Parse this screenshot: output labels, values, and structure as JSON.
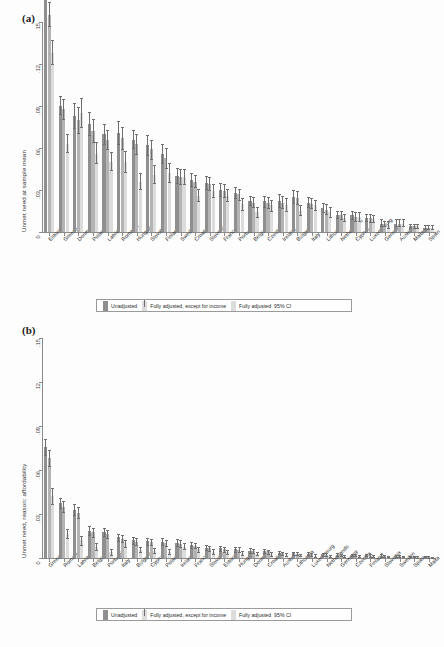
{
  "figure": {
    "panel_a_tag": "(a)",
    "panel_b_tag": "(b)"
  },
  "legend": {
    "unadjusted": "Unadjusted",
    "except_income": "Fully adjusted, except for income",
    "fully_adjusted": "Fully adjusted",
    "ci": "95% CI"
  },
  "chart_data": [
    {
      "type": "bar",
      "panel": "(a)",
      "title": "",
      "xlabel": "",
      "ylabel": "Unmet need at sample mean",
      "ylim": [
        0,
        0.15
      ],
      "yticks": [
        0,
        0.03,
        0.06,
        0.09,
        0.12,
        0.15
      ],
      "ytick_labels": [
        "0",
        ".03",
        ".06",
        ".09",
        ".12",
        ".15"
      ],
      "grid": false,
      "legend_position": "below-plot",
      "error_bars": "95% CI",
      "categories": [
        "Estonia",
        "Greece",
        "Denmark",
        "Poland",
        "Latvia",
        "Romania",
        "Hungary",
        "Slovakia",
        "Finland",
        "Sweden",
        "Croatia",
        "Slovenia",
        "France",
        "Portugal",
        "Belgium",
        "Czechia",
        "Ireland",
        "Bulgaria",
        "Italy",
        "Lithuania",
        "Netherlands",
        "Cyprus",
        "Luxembourg",
        "Germany",
        "Austria",
        "Malta",
        "Spain"
      ],
      "series": [
        {
          "name": "Unadjusted",
          "color": "#8f8f8f",
          "values": [
            0.176,
            0.09,
            0.083,
            0.077,
            0.07,
            0.071,
            0.066,
            0.062,
            0.056,
            0.04,
            0.037,
            0.035,
            0.03,
            0.028,
            0.022,
            0.022,
            0.022,
            0.025,
            0.021,
            0.017,
            0.012,
            0.012,
            0.01,
            0.006,
            0.006,
            0.004,
            0.003
          ],
          "ci_low": [
            0.168,
            0.084,
            0.074,
            0.069,
            0.063,
            0.063,
            0.06,
            0.055,
            0.049,
            0.035,
            0.033,
            0.031,
            0.026,
            0.024,
            0.019,
            0.018,
            0.018,
            0.021,
            0.018,
            0.014,
            0.01,
            0.009,
            0.008,
            0.004,
            0.004,
            0.003,
            0.002
          ],
          "ci_high": [
            0.185,
            0.097,
            0.092,
            0.086,
            0.077,
            0.079,
            0.073,
            0.069,
            0.063,
            0.046,
            0.042,
            0.04,
            0.035,
            0.032,
            0.026,
            0.026,
            0.027,
            0.03,
            0.025,
            0.021,
            0.015,
            0.015,
            0.013,
            0.009,
            0.009,
            0.006,
            0.005
          ]
        },
        {
          "name": "Fully adjusted, except for income",
          "color": "#b4b4b4",
          "values": [
            0.155,
            0.088,
            0.08,
            0.072,
            0.066,
            0.067,
            0.063,
            0.059,
            0.053,
            0.039,
            0.036,
            0.034,
            0.029,
            0.027,
            0.021,
            0.021,
            0.021,
            0.024,
            0.02,
            0.016,
            0.012,
            0.011,
            0.01,
            0.006,
            0.006,
            0.004,
            0.003
          ],
          "ci_low": [
            0.147,
            0.081,
            0.071,
            0.064,
            0.059,
            0.059,
            0.056,
            0.052,
            0.046,
            0.034,
            0.032,
            0.03,
            0.025,
            0.023,
            0.018,
            0.017,
            0.017,
            0.02,
            0.017,
            0.013,
            0.009,
            0.008,
            0.007,
            0.004,
            0.004,
            0.003,
            0.002
          ],
          "ci_high": [
            0.164,
            0.095,
            0.089,
            0.081,
            0.073,
            0.075,
            0.07,
            0.066,
            0.06,
            0.045,
            0.041,
            0.039,
            0.034,
            0.031,
            0.025,
            0.025,
            0.026,
            0.029,
            0.024,
            0.02,
            0.015,
            0.014,
            0.013,
            0.008,
            0.009,
            0.006,
            0.005
          ]
        },
        {
          "name": "Fully adjusted",
          "color": "#dcdcdc",
          "values": [
            0.128,
            0.063,
            0.085,
            0.056,
            0.05,
            0.05,
            0.036,
            0.041,
            0.042,
            0.039,
            0.026,
            0.029,
            0.026,
            0.02,
            0.014,
            0.019,
            0.019,
            0.015,
            0.019,
            0.014,
            0.01,
            0.011,
            0.009,
            0.005,
            0.006,
            0.004,
            0.003
          ],
          "ci_low": [
            0.12,
            0.057,
            0.075,
            0.049,
            0.044,
            0.043,
            0.031,
            0.035,
            0.036,
            0.034,
            0.022,
            0.025,
            0.022,
            0.016,
            0.011,
            0.015,
            0.015,
            0.012,
            0.016,
            0.011,
            0.008,
            0.008,
            0.007,
            0.003,
            0.004,
            0.003,
            0.002
          ],
          "ci_high": [
            0.137,
            0.07,
            0.096,
            0.064,
            0.057,
            0.058,
            0.042,
            0.048,
            0.049,
            0.045,
            0.031,
            0.034,
            0.031,
            0.024,
            0.018,
            0.023,
            0.024,
            0.019,
            0.023,
            0.018,
            0.013,
            0.014,
            0.012,
            0.008,
            0.009,
            0.006,
            0.005
          ]
        }
      ]
    },
    {
      "type": "bar",
      "panel": "(b)",
      "title": "",
      "xlabel": "",
      "ylabel": "Unmet need, reason: affordability",
      "ylim": [
        0,
        0.15
      ],
      "yticks": [
        0,
        0.03,
        0.06,
        0.09,
        0.12,
        0.15
      ],
      "ytick_labels": [
        "0",
        ".03",
        ".06",
        ".09",
        ".12",
        ".15"
      ],
      "grid": false,
      "legend_position": "below-plot",
      "error_bars": "95% CI",
      "categories": [
        "Greece",
        "Romania",
        "Latvia",
        "Belgium",
        "Portugal",
        "Italy",
        "Bulgaria",
        "Cyprus",
        "Poland",
        "Ireland",
        "France",
        "Slovakia",
        "Estonia",
        "Hungary",
        "Denmark",
        "Croatia",
        "Austria",
        "Lithuania",
        "Luxembourg",
        "Netherlands",
        "Germany",
        "Czechia",
        "Finland",
        "Slovenia",
        "Sweden",
        "Spain",
        "Malta"
      ],
      "series": [
        {
          "name": "Unadjusted",
          "color": "#8f8f8f",
          "values": [
            0.0755,
            0.0375,
            0.033,
            0.0185,
            0.0175,
            0.014,
            0.012,
            0.0115,
            0.011,
            0.0105,
            0.009,
            0.007,
            0.0065,
            0.006,
            0.005,
            0.0045,
            0.0035,
            0.0032,
            0.0028,
            0.0025,
            0.0022,
            0.002,
            0.0018,
            0.0016,
            0.0014,
            0.001,
            0.0008
          ],
          "ci_low": [
            0.07,
            0.034,
            0.0295,
            0.0155,
            0.0148,
            0.0115,
            0.0098,
            0.0092,
            0.0088,
            0.0083,
            0.007,
            0.0053,
            0.0048,
            0.0044,
            0.0036,
            0.0032,
            0.0024,
            0.0021,
            0.0018,
            0.0016,
            0.0014,
            0.0012,
            0.0011,
            0.0009,
            0.0008,
            0.0005,
            0.0004
          ],
          "ci_high": [
            0.081,
            0.0412,
            0.0368,
            0.0216,
            0.0204,
            0.0166,
            0.0143,
            0.0139,
            0.0133,
            0.0128,
            0.0111,
            0.0088,
            0.0083,
            0.0077,
            0.0065,
            0.0059,
            0.0047,
            0.0043,
            0.0039,
            0.0035,
            0.0031,
            0.0029,
            0.0026,
            0.0024,
            0.0021,
            0.0016,
            0.0013
          ]
        },
        {
          "name": "Fully adjusted, except for income",
          "color": "#b4b4b4",
          "values": [
            0.068,
            0.035,
            0.031,
            0.0175,
            0.0165,
            0.0132,
            0.0112,
            0.0108,
            0.0102,
            0.0098,
            0.0085,
            0.0065,
            0.006,
            0.0056,
            0.0046,
            0.0042,
            0.0033,
            0.003,
            0.0026,
            0.0023,
            0.0021,
            0.0019,
            0.0017,
            0.0015,
            0.0013,
            0.0009,
            0.0007
          ],
          "ci_low": [
            0.0625,
            0.0315,
            0.0275,
            0.0146,
            0.0138,
            0.0108,
            0.0091,
            0.0086,
            0.0081,
            0.0077,
            0.0066,
            0.0049,
            0.0044,
            0.0041,
            0.0033,
            0.003,
            0.0022,
            0.002,
            0.0017,
            0.0015,
            0.0013,
            0.0011,
            0.001,
            0.0008,
            0.0007,
            0.0004,
            0.0003
          ],
          "ci_high": [
            0.0735,
            0.0386,
            0.0346,
            0.0205,
            0.0193,
            0.0157,
            0.0134,
            0.0131,
            0.0124,
            0.012,
            0.0105,
            0.0082,
            0.0077,
            0.0072,
            0.006,
            0.0055,
            0.0044,
            0.004,
            0.0036,
            0.0032,
            0.0029,
            0.0027,
            0.0024,
            0.0022,
            0.0019,
            0.0014,
            0.0011
          ]
        },
        {
          "name": "Fully adjusted",
          "color": "#dcdcdc",
          "values": [
            0.0425,
            0.0165,
            0.012,
            0.0075,
            0.004,
            0.01,
            0.0055,
            0.0048,
            0.0042,
            0.0078,
            0.006,
            0.0042,
            0.0038,
            0.0034,
            0.003,
            0.0026,
            0.0022,
            0.002,
            0.0017,
            0.0015,
            0.0014,
            0.0012,
            0.0011,
            0.001,
            0.0009,
            0.0006,
            0.0005
          ],
          "ci_low": [
            0.037,
            0.0135,
            0.0092,
            0.0052,
            0.0022,
            0.0078,
            0.0038,
            0.0032,
            0.0027,
            0.0058,
            0.0043,
            0.0027,
            0.0024,
            0.0021,
            0.0018,
            0.0015,
            0.0012,
            0.0011,
            0.0009,
            0.0008,
            0.0007,
            0.0006,
            0.0005,
            0.0004,
            0.0004,
            0.0002,
            0.0001
          ],
          "ci_high": [
            0.048,
            0.0196,
            0.0149,
            0.0099,
            0.006,
            0.0123,
            0.0073,
            0.0065,
            0.0058,
            0.0099,
            0.0078,
            0.0058,
            0.0053,
            0.0048,
            0.0042,
            0.0038,
            0.0032,
            0.003,
            0.0026,
            0.0023,
            0.0021,
            0.0019,
            0.0018,
            0.0016,
            0.0015,
            0.0011,
            0.0009
          ]
        }
      ]
    }
  ]
}
